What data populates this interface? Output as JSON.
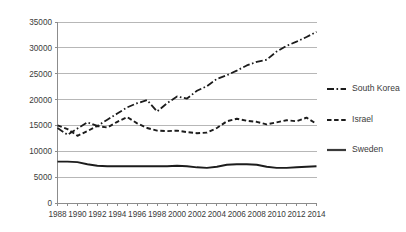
{
  "chart_data": {
    "type": "line",
    "title": "",
    "subtitle": "",
    "xlabel": "",
    "ylabel": "",
    "x": [
      1988,
      1989,
      1990,
      1991,
      1992,
      1993,
      1994,
      1995,
      1996,
      1997,
      1998,
      1999,
      2000,
      2001,
      2002,
      2003,
      2004,
      2005,
      2006,
      2007,
      2008,
      2009,
      2010,
      2011,
      2012,
      2013,
      2014
    ],
    "xlim": [
      1988,
      2014
    ],
    "ylim": [
      0,
      35000
    ],
    "grid": true,
    "legend_position": "right",
    "x_tick_labels": [
      "1988",
      "1990",
      "1992",
      "1994",
      "1996",
      "1998",
      "2000",
      "2002",
      "2004",
      "2006",
      "2008",
      "2010",
      "2012",
      "2014"
    ],
    "x_tick_values": [
      1988,
      1990,
      1992,
      1994,
      1996,
      1998,
      2000,
      2002,
      2004,
      2006,
      2008,
      2010,
      2012,
      2014
    ],
    "y_tick_labels": [
      "0",
      "5000",
      "10000",
      "15000",
      "20000",
      "25000",
      "30000",
      "35000"
    ],
    "y_tick_values": [
      0,
      5000,
      10000,
      15000,
      20000,
      25000,
      30000,
      35000
    ],
    "series": [
      {
        "name": "South Korea",
        "style": "dashdot",
        "color": "#1c1c1c",
        "width": 1.8,
        "dash": "7,2.5,1.6,2.5",
        "values": [
          14500,
          13200,
          14400,
          15600,
          14900,
          16100,
          17300,
          18500,
          19300,
          19900,
          17700,
          19300,
          20600,
          20200,
          21700,
          22600,
          24000,
          24700,
          25600,
          26600,
          27300,
          27700,
          29300,
          30400,
          31200,
          32100,
          33100
        ]
      },
      {
        "name": "Israel",
        "style": "dashed",
        "color": "#1c1c1c",
        "width": 1.9,
        "dash": "4.5,2.6",
        "values": [
          15000,
          14300,
          13000,
          13900,
          14900,
          14600,
          15700,
          16600,
          15400,
          14500,
          14000,
          13900,
          14000,
          13700,
          13500,
          13600,
          14500,
          15800,
          16300,
          15900,
          15700,
          15200,
          15600,
          16000,
          15800,
          16500,
          15300
        ]
      },
      {
        "name": "Sweden",
        "style": "solid",
        "color": "#3a3a3a",
        "width": 1.9,
        "dash": "none",
        "values": [
          8000,
          8000,
          7900,
          7500,
          7200,
          7100,
          7100,
          7100,
          7100,
          7100,
          7100,
          7100,
          7200,
          7100,
          6900,
          6800,
          7000,
          7400,
          7500,
          7500,
          7400,
          7000,
          6800,
          6800,
          6900,
          7000,
          7100
        ]
      }
    ]
  },
  "legend": {
    "items": [
      {
        "label": "South Korea"
      },
      {
        "label": "Israel"
      },
      {
        "label": "Sweden"
      }
    ]
  }
}
